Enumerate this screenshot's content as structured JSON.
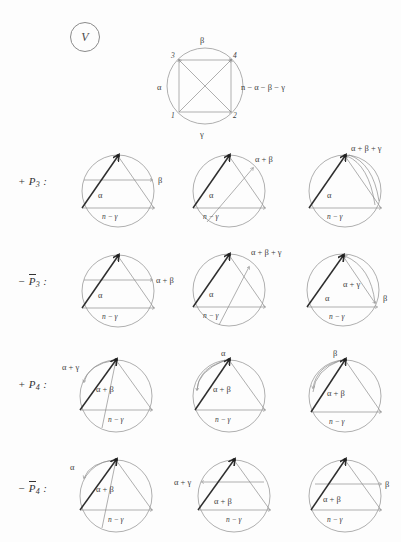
{
  "figure": {
    "tag": "V",
    "caption_label": "V"
  },
  "top_diagram": {
    "name": "master-square-diagram",
    "vertices": [
      "1",
      "2",
      "3",
      "4"
    ],
    "labels": {
      "top": "β",
      "bottom": "γ",
      "left": "α",
      "right": "n − α − β − γ"
    }
  },
  "rows": [
    {
      "id": "row-p3-plus",
      "label_prefix": "+",
      "label_letter": "P",
      "label_sub": "3",
      "label_bar": false,
      "label_suffix": ":",
      "label_text": "+ P3 :",
      "cells": [
        {
          "id": "p3-plus-1",
          "labels": [
            {
              "text": "α",
              "x": 38,
              "y": 58
            },
            {
              "text": "β",
              "x": 92,
              "y": 35
            },
            {
              "text": "n − γ",
              "x": 42,
              "y": 74
            }
          ]
        },
        {
          "id": "p3-plus-2",
          "labels": [
            {
              "text": "α",
              "x": 34,
              "y": 58
            },
            {
              "text": "α + β",
              "x": 82,
              "y": 16
            },
            {
              "text": "n − γ",
              "x": 28,
              "y": 74
            }
          ]
        },
        {
          "id": "p3-plus-3",
          "labels": [
            {
              "text": "α",
              "x": 36,
              "y": 58
            },
            {
              "text": "α + β + γ",
              "x": 68,
              "y": 8
            },
            {
              "text": "n − γ",
              "x": 36,
              "y": 74
            }
          ]
        }
      ]
    },
    {
      "id": "row-p3-minus",
      "label_prefix": "−",
      "label_letter": "P",
      "label_sub": "3",
      "label_bar": true,
      "label_suffix": ":",
      "label_text": "− P̅3 :",
      "cells": [
        {
          "id": "p3-minus-1",
          "labels": [
            {
              "text": "α",
              "x": 38,
              "y": 58
            },
            {
              "text": "α + β",
              "x": 90,
              "y": 35
            },
            {
              "text": "n − γ",
              "x": 42,
              "y": 74
            }
          ]
        },
        {
          "id": "p3-minus-2",
          "labels": [
            {
              "text": "α",
              "x": 34,
              "y": 58
            },
            {
              "text": "α + β + γ",
              "x": 80,
              "y": 12
            },
            {
              "text": "n − γ",
              "x": 28,
              "y": 74
            }
          ]
        },
        {
          "id": "p3-minus-3",
          "labels": [
            {
              "text": "α",
              "x": 32,
              "y": 60
            },
            {
              "text": "α + γ",
              "x": 52,
              "y": 48
            },
            {
              "text": "β",
              "x": 96,
              "y": 60
            },
            {
              "text": "n − γ",
              "x": 40,
              "y": 76
            }
          ]
        }
      ]
    },
    {
      "id": "row-p4-plus",
      "label_prefix": "+",
      "label_letter": "P",
      "label_sub": "4",
      "label_bar": false,
      "label_suffix": ":",
      "label_text": "+ P4 :",
      "cells": [
        {
          "id": "p4-plus-1",
          "labels": [
            {
              "text": "α + γ",
              "x": -6,
              "y": 12
            },
            {
              "text": "α + β",
              "x": 42,
              "y": 44
            },
            {
              "text": "n − γ",
              "x": 52,
              "y": 76
            }
          ]
        },
        {
          "id": "p4-plus-2",
          "labels": [
            {
              "text": "α",
              "x": 40,
              "y": 6
            },
            {
              "text": "α + β",
              "x": 42,
              "y": 44
            },
            {
              "text": "n − γ",
              "x": 44,
              "y": 76
            }
          ]
        },
        {
          "id": "p4-plus-3",
          "labels": [
            {
              "text": "β",
              "x": 38,
              "y": 6
            },
            {
              "text": "α + β",
              "x": 40,
              "y": 48
            },
            {
              "text": "n − γ",
              "x": 42,
              "y": 76
            }
          ]
        }
      ]
    },
    {
      "id": "row-p4-minus",
      "label_prefix": "−",
      "label_letter": "P",
      "label_sub": "4",
      "label_bar": true,
      "label_suffix": ":",
      "label_text": "− P̅4 :",
      "cells": [
        {
          "id": "p4-minus-1",
          "labels": [
            {
              "text": "α",
              "x": 2,
              "y": 16
            },
            {
              "text": "α + β",
              "x": 42,
              "y": 44
            },
            {
              "text": "n − γ",
              "x": 52,
              "y": 76
            }
          ]
        },
        {
          "id": "p4-minus-2",
          "labels": [
            {
              "text": "α + γ",
              "x": -10,
              "y": 34
            },
            {
              "text": "α + β",
              "x": 38,
              "y": 56
            },
            {
              "text": "n − γ",
              "x": 52,
              "y": 76
            }
          ]
        },
        {
          "id": "p4-minus-3",
          "labels": [
            {
              "text": "β",
              "x": 96,
              "y": 36
            },
            {
              "text": "α + β",
              "x": 34,
              "y": 54
            },
            {
              "text": "n − γ",
              "x": 38,
              "y": 76
            }
          ]
        }
      ]
    }
  ],
  "colors": {
    "ink": "#2e2e2e",
    "thin_line": "#8d8d8d",
    "circle": "#9a9a9a",
    "paper": "#fdfdfd"
  }
}
